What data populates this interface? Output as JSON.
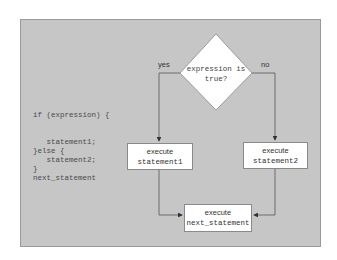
{
  "code": {
    "lines": [
      "if (expression) {",
      "",
      "",
      "   statement1;",
      "}else {",
      "   statement2;",
      "}",
      "next_statement"
    ]
  },
  "flowchart": {
    "decision": {
      "line1": "expression is",
      "line2": "true?"
    },
    "yes_label": "yes",
    "no_label": "no",
    "box1": {
      "line1": "execute",
      "line2": "statement1"
    },
    "box2": {
      "line1": "execute",
      "line2": "statement2"
    },
    "box3": {
      "line1": "execute",
      "line2": "next_statement"
    }
  },
  "colors": {
    "panel": "#c6c6c6",
    "box": "#ffffff",
    "line": "#555555"
  }
}
